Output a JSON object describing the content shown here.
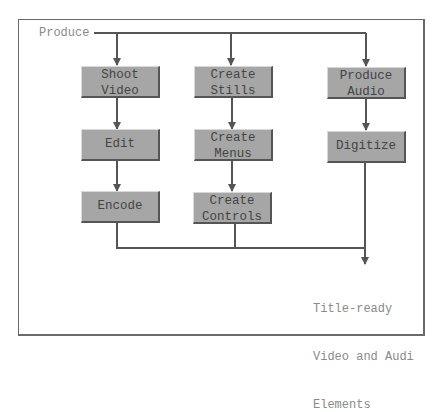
{
  "diagram": {
    "type": "flowchart",
    "source_label": "Produce",
    "nodes": [
      {
        "id": "shoot_video",
        "label_line1": "Shoot",
        "label_line2": "Video"
      },
      {
        "id": "edit",
        "label": "Edit"
      },
      {
        "id": "encode",
        "label": "Encode"
      },
      {
        "id": "create_stills",
        "label_line1": "Create",
        "label_line2": "Stills"
      },
      {
        "id": "create_menus",
        "label_line1": "Create",
        "label_line2": "Menus"
      },
      {
        "id": "create_controls",
        "label_line1": "Create",
        "label_line2": "Controls"
      },
      {
        "id": "produce_audio",
        "label_line1": "Produce",
        "label_line2": "Audio"
      },
      {
        "id": "digitize",
        "label": "Digitize"
      }
    ],
    "output_label": {
      "line1": "Title-ready",
      "line2": "Video and Audi",
      "line3": "Elements"
    },
    "edges": [
      [
        "Produce",
        "Shoot Video"
      ],
      [
        "Produce",
        "Create Stills"
      ],
      [
        "Produce",
        "Produce Audio"
      ],
      [
        "Shoot Video",
        "Edit"
      ],
      [
        "Edit",
        "Encode"
      ],
      [
        "Create Stills",
        "Create Menus"
      ],
      [
        "Create Menus",
        "Create Controls"
      ],
      [
        "Produce Audio",
        "Digitize"
      ],
      [
        "Encode",
        "Title-ready Video and Audi Elements"
      ],
      [
        "Create Controls",
        "Title-ready Video and Audi Elements"
      ],
      [
        "Digitize",
        "Title-ready Video and Audi Elements"
      ]
    ],
    "colors": {
      "box_fill": "#a6a6a6",
      "line": "#555555",
      "text": "#444444",
      "label_text": "#8a8a8a"
    }
  }
}
